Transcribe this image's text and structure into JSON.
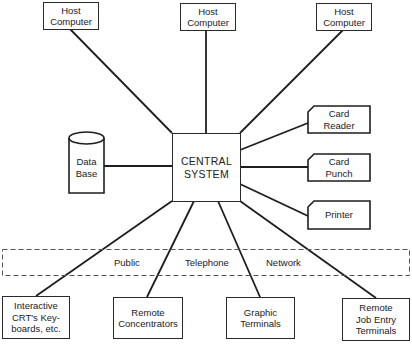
{
  "diagram": {
    "central": {
      "label": "CENTRAL\nSYSTEM"
    },
    "hosts": [
      {
        "label": "Host\nComputer"
      },
      {
        "label": "Host\nComputer"
      },
      {
        "label": "Host\nComputer"
      }
    ],
    "data_base": {
      "label": "Data\nBase"
    },
    "peripherals": [
      {
        "label": "Card\nReader"
      },
      {
        "label": "Card\nPunch"
      },
      {
        "label": "Printer"
      }
    ],
    "network": {
      "words": [
        "Public",
        "Telephone",
        "Network"
      ]
    },
    "remote": [
      {
        "label": "Interactive\nCRT's Key-\nboards, etc."
      },
      {
        "label": "Remote\nConcentrators"
      },
      {
        "label": "Graphic\nTerminals"
      },
      {
        "label": "Remote\nJob Entry\nTerminals"
      }
    ]
  },
  "colors": {
    "line": "#2a2a2a",
    "background": "#ffffff",
    "dash": "#555555"
  }
}
